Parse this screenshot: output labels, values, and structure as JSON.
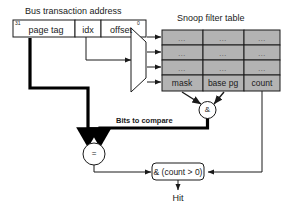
{
  "diagram": {
    "address_bar": {
      "caption": "Bus transaction address",
      "msb_label": "31",
      "lsb_label": "0",
      "fields": [
        {
          "name": "page tag",
          "label": "page tag"
        },
        {
          "name": "idx",
          "label": "idx"
        },
        {
          "name": "offset",
          "label": "offset"
        }
      ]
    },
    "table": {
      "caption": "Snoop filter table",
      "columns": [
        "mask",
        "base pg",
        "count"
      ],
      "placeholder_cell": "...",
      "placeholder_row_count": 3,
      "rows": [
        [
          "...",
          "...",
          "..."
        ],
        [
          "...",
          "...",
          "..."
        ],
        [
          "...",
          "...",
          "..."
        ],
        [
          "mask",
          "base pg",
          "count"
        ]
      ]
    },
    "mux": {
      "name": "index-decoder",
      "output_count": 4
    },
    "gates": {
      "and_mask": "&",
      "compare": "=",
      "final": "& (count > 0)"
    },
    "labels": {
      "bits_to_compare": "Bits to compare",
      "output": "Hit"
    },
    "colors": {
      "cell_fill": "#b3b3b3",
      "line": "#1a1a1a",
      "thick_line": "#000000",
      "background": "#ffffff",
      "text": "#1a1a1a"
    }
  }
}
